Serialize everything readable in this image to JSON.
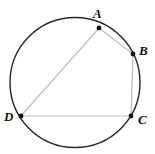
{
  "figure": {
    "name": "cyclic-quadrilateral-inscribed-in-circle",
    "width": 155,
    "height": 154,
    "background_color": "#ffffff",
    "circle": {
      "center_x": 75,
      "center_y": 82.5,
      "radius": 65,
      "stroke_color": "#262626",
      "stroke_width": 1.4,
      "fill": "none"
    },
    "chord_color": "#bdbdbd",
    "chord_width": 1.2,
    "point_color": "#111111",
    "point_radius": 2.4,
    "points": [
      {
        "label": "A",
        "x": 99,
        "y": 28,
        "label_x": 93,
        "label_y": 7
      },
      {
        "label": "B",
        "x": 133,
        "y": 54,
        "label_x": 139,
        "label_y": 44
      },
      {
        "label": "C",
        "x": 131,
        "y": 116,
        "label_x": 138,
        "label_y": 113
      },
      {
        "label": "D",
        "x": 21,
        "y": 116,
        "label_x": 4,
        "label_y": 110
      }
    ],
    "chords": [
      {
        "name": "segment-AB",
        "from": "A",
        "to": "B"
      },
      {
        "name": "segment-BC",
        "from": "B",
        "to": "C"
      },
      {
        "name": "segment-CD",
        "from": "C",
        "to": "D"
      },
      {
        "name": "segment-DA",
        "from": "D",
        "to": "A"
      }
    ]
  }
}
